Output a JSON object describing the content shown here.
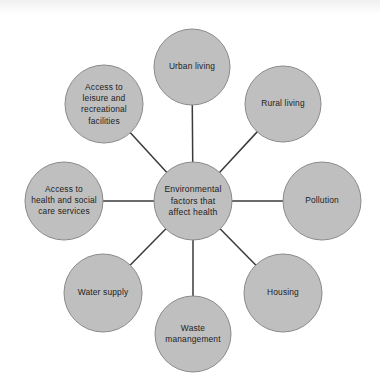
{
  "colors": {
    "page_background": "#ffffff",
    "node_fill": "#bfbfbf",
    "node_stroke": "#8a8a8a",
    "connector": "#3a3a3a",
    "text": "#1d1d1d"
  },
  "chart_data": {
    "type": "diagram",
    "diagram_kind": "hub-and-spoke",
    "hub": {
      "label": "Environmental\nfactors that\naffect health",
      "lines": [
        "Environmental",
        "factors that",
        "affect health"
      ],
      "cx": 193,
      "cy": 201,
      "r": 39
    },
    "spoke_count": 8,
    "nodes": [
      {
        "id": "urban-living",
        "label": "Urban living",
        "lines": [
          "Urban living"
        ],
        "position": "top",
        "angle_deg": 90,
        "cx": 192,
        "cy": 67,
        "r": 38
      },
      {
        "id": "rural-living",
        "label": "Rural living",
        "lines": [
          "Rural living"
        ],
        "position": "top-right",
        "angle_deg": 45,
        "cx": 283,
        "cy": 104,
        "r": 38
      },
      {
        "id": "pollution",
        "label": "Pollution",
        "lines": [
          "Pollution"
        ],
        "position": "right",
        "angle_deg": 0,
        "cx": 322,
        "cy": 201,
        "r": 39
      },
      {
        "id": "housing",
        "label": "Housing",
        "lines": [
          "Housing"
        ],
        "position": "bottom-right",
        "angle_deg": -45,
        "cx": 283,
        "cy": 293,
        "r": 39
      },
      {
        "id": "waste-manangement",
        "label": "Waste\nmanangement",
        "lines": [
          "Waste",
          "manangement"
        ],
        "position": "bottom",
        "angle_deg": -90,
        "cx": 193,
        "cy": 334,
        "r": 38
      },
      {
        "id": "water-supply",
        "label": "Water supply",
        "lines": [
          "Water supply"
        ],
        "position": "bottom-left",
        "angle_deg": -135,
        "cx": 103,
        "cy": 293,
        "r": 39
      },
      {
        "id": "access-to-health-and-social-care-services",
        "label": "Access to\nhealth and social\ncare services",
        "lines": [
          "Access to",
          "health and social",
          "care services"
        ],
        "position": "left",
        "angle_deg": 180,
        "cx": 64,
        "cy": 201,
        "r": 39
      },
      {
        "id": "access-to-leisure-and-recreational-facilities",
        "label": "Access to\nleisure and\nrecreational\nfacilities",
        "lines": [
          "Access to",
          "leisure and",
          "recreational",
          "facilities"
        ],
        "position": "top-left",
        "angle_deg": 135,
        "cx": 104,
        "cy": 104,
        "r": 39
      }
    ],
    "connectors": [
      {
        "from": "hub",
        "to": "urban-living"
      },
      {
        "from": "hub",
        "to": "rural-living"
      },
      {
        "from": "hub",
        "to": "pollution"
      },
      {
        "from": "hub",
        "to": "housing"
      },
      {
        "from": "hub",
        "to": "waste-manangement"
      },
      {
        "from": "hub",
        "to": "water-supply"
      },
      {
        "from": "hub",
        "to": "access-to-health-and-social-care-services"
      },
      {
        "from": "hub",
        "to": "access-to-leisure-and-recreational-facilities"
      }
    ]
  }
}
